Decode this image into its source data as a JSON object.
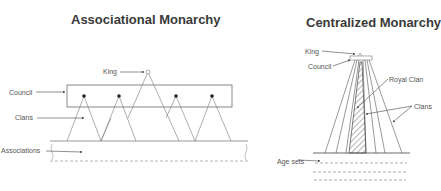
{
  "left": {
    "title": "Associational Monarchy",
    "labels": {
      "king": "King",
      "council": "Council",
      "clans": "Clans",
      "associations": "Associations"
    }
  },
  "right": {
    "title": "Centralized Monarchy",
    "labels": {
      "king": "King",
      "council": "Council",
      "royal_clan": "Royal Clan",
      "clans": "Clans",
      "age_sets": "Age sets"
    }
  }
}
